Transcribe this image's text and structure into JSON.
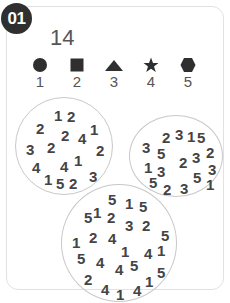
{
  "badge": "01",
  "target_number": "14",
  "legend": [
    {
      "shape": "circle-icon",
      "value": "1"
    },
    {
      "shape": "square-icon",
      "value": "2"
    },
    {
      "shape": "triangle-icon",
      "value": "3"
    },
    {
      "shape": "star-icon",
      "value": "4"
    },
    {
      "shape": "hexagon-icon",
      "value": "5"
    }
  ],
  "circles": [
    {
      "name": "number-circle-1",
      "numbers": [
        {
          "v": "1",
          "x": 38,
          "y": 10
        },
        {
          "v": "2",
          "x": 51,
          "y": 11
        },
        {
          "v": "2",
          "x": 20,
          "y": 23
        },
        {
          "v": "1",
          "x": 74,
          "y": 24
        },
        {
          "v": "2",
          "x": 45,
          "y": 30
        },
        {
          "v": "4",
          "x": 62,
          "y": 33
        },
        {
          "v": "3",
          "x": 10,
          "y": 44
        },
        {
          "v": "2",
          "x": 31,
          "y": 42
        },
        {
          "v": "2",
          "x": 80,
          "y": 45
        },
        {
          "v": "1",
          "x": 58,
          "y": 55
        },
        {
          "v": "4",
          "x": 44,
          "y": 61
        },
        {
          "v": "4",
          "x": 16,
          "y": 62
        },
        {
          "v": "3",
          "x": 73,
          "y": 71
        },
        {
          "v": "1",
          "x": 28,
          "y": 74
        },
        {
          "v": "5",
          "x": 40,
          "y": 78
        },
        {
          "v": "2",
          "x": 53,
          "y": 78
        }
      ]
    },
    {
      "name": "number-circle-2",
      "numbers": [
        {
          "v": "2",
          "x": 32,
          "y": 14
        },
        {
          "v": "3",
          "x": 45,
          "y": 11
        },
        {
          "v": "1",
          "x": 57,
          "y": 13
        },
        {
          "v": "5",
          "x": 67,
          "y": 14
        },
        {
          "v": "3",
          "x": 12,
          "y": 24
        },
        {
          "v": "2",
          "x": 76,
          "y": 29
        },
        {
          "v": "5",
          "x": 27,
          "y": 30
        },
        {
          "v": "2",
          "x": 49,
          "y": 39
        },
        {
          "v": "3",
          "x": 62,
          "y": 34
        },
        {
          "v": "1",
          "x": 14,
          "y": 44
        },
        {
          "v": "3",
          "x": 27,
          "y": 48
        },
        {
          "v": "3",
          "x": 78,
          "y": 46
        },
        {
          "v": "5",
          "x": 63,
          "y": 54
        },
        {
          "v": "1",
          "x": 76,
          "y": 61
        },
        {
          "v": "5",
          "x": 19,
          "y": 59
        },
        {
          "v": "2",
          "x": 33,
          "y": 66
        },
        {
          "v": "3",
          "x": 50,
          "y": 65
        }
      ]
    },
    {
      "name": "number-circle-3",
      "numbers": [
        {
          "v": "5",
          "x": 46,
          "y": 7
        },
        {
          "v": "1",
          "x": 63,
          "y": 11
        },
        {
          "v": "5",
          "x": 77,
          "y": 14
        },
        {
          "v": "5",
          "x": 22,
          "y": 25
        },
        {
          "v": "1",
          "x": 31,
          "y": 20
        },
        {
          "v": "2",
          "x": 45,
          "y": 25
        },
        {
          "v": "3",
          "x": 63,
          "y": 33
        },
        {
          "v": "2",
          "x": 80,
          "y": 33
        },
        {
          "v": "5",
          "x": 99,
          "y": 43
        },
        {
          "v": "1",
          "x": 10,
          "y": 50
        },
        {
          "v": "2",
          "x": 27,
          "y": 45
        },
        {
          "v": "4",
          "x": 46,
          "y": 46
        },
        {
          "v": "1",
          "x": 59,
          "y": 59
        },
        {
          "v": "4",
          "x": 82,
          "y": 61
        },
        {
          "v": "1",
          "x": 95,
          "y": 58
        },
        {
          "v": "5",
          "x": 15,
          "y": 66
        },
        {
          "v": "4",
          "x": 34,
          "y": 70
        },
        {
          "v": "4",
          "x": 53,
          "y": 77
        },
        {
          "v": "5",
          "x": 68,
          "y": 73
        },
        {
          "v": "5",
          "x": 95,
          "y": 80
        },
        {
          "v": "2",
          "x": 22,
          "y": 87
        },
        {
          "v": "1",
          "x": 83,
          "y": 89
        },
        {
          "v": "4",
          "x": 39,
          "y": 97
        },
        {
          "v": "1",
          "x": 54,
          "y": 102
        },
        {
          "v": "4",
          "x": 71,
          "y": 98
        }
      ]
    }
  ]
}
